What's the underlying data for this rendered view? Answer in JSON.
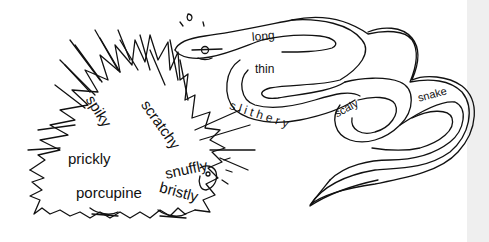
{
  "illustration": {
    "background": "#ffffff",
    "line_color": "#111111",
    "side_strip_color": "#efefef",
    "porcupine": {
      "name": "porcupine",
      "words": [
        "spiky",
        "scratchy",
        "prickly",
        "snuffly",
        "bristly",
        "porcupine"
      ]
    },
    "snake": {
      "name": "snake",
      "words": [
        "long",
        "thin",
        "slithery",
        "scaly",
        "snake"
      ]
    }
  },
  "labels": {
    "spiky": "spiky",
    "scratchy": "scratchy",
    "prickly": "prickly",
    "snuffly": "snuffly",
    "bristly": "bristly",
    "porcupine": "porcupine",
    "long": "long",
    "thin": "thin",
    "slithery": "s l i t h e r y",
    "scaly": "scaly",
    "snake": "snake"
  }
}
